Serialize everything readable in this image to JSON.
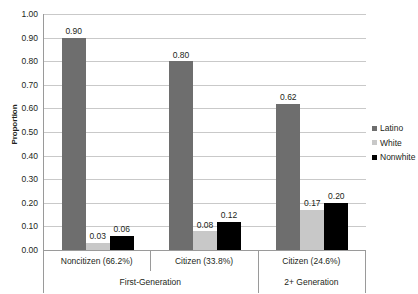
{
  "chart_data": {
    "type": "bar",
    "title": "",
    "xlabel": "",
    "ylabel": "Proportion",
    "ylim": [
      0.0,
      1.0
    ],
    "ytick_step": 0.1,
    "ytick_labels": [
      "1.00",
      "0.90",
      "0.80",
      "0.70",
      "0.60",
      "0.50",
      "0.40",
      "0.30",
      "0.20",
      "0.10",
      "0.00"
    ],
    "grid": true,
    "legend_position": "right",
    "categories": [
      "Noncitizen (66.2%)",
      "Citizen (33.8%)",
      "Citizen (24.6%)"
    ],
    "category_groups": [
      {
        "label": "First-Generation",
        "categories": [
          "Noncitizen (66.2%)",
          "Citizen (33.8%)"
        ]
      },
      {
        "label": "2+ Generation",
        "categories": [
          "Citizen (24.6%)"
        ]
      }
    ],
    "series": [
      {
        "name": "Latino",
        "color": "#6e6e6e",
        "values": [
          0.9,
          0.8,
          0.62
        ],
        "labels": [
          "0.90",
          "0.80",
          "0.62"
        ]
      },
      {
        "name": "White",
        "color": "#c8c8c8",
        "values": [
          0.03,
          0.08,
          0.17
        ],
        "labels": [
          "0.03",
          "0.08",
          "0.17"
        ]
      },
      {
        "name": "Nonwhite",
        "color": "#000000",
        "values": [
          0.06,
          0.12,
          0.2
        ],
        "labels": [
          "0.06",
          "0.12",
          "0.20"
        ]
      }
    ]
  },
  "legend": {
    "items": [
      {
        "label": "Latino",
        "color": "#6e6e6e"
      },
      {
        "label": "White",
        "color": "#c8c8c8"
      },
      {
        "label": "Nonwhite",
        "color": "#000000"
      }
    ]
  },
  "axes": {
    "y_title": "Proportion"
  }
}
